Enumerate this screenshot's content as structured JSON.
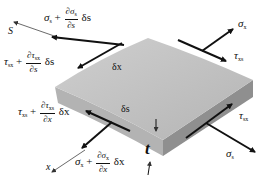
{
  "diagram": {
    "type": "plate-element-stress-diagram",
    "colors": {
      "plate_top": "#c2c2c2",
      "plate_front": "#a9a9a9",
      "plate_side": "#8e8e8e",
      "arrow": "#111111",
      "text": "#111111"
    },
    "labels": {
      "s_axis": "S",
      "x_axis": "x",
      "thickness": "t",
      "delta_x_edge": "δx",
      "delta_s_edge": "δs",
      "sigma_x": "σ",
      "sigma_x_sub": "x",
      "tau_xs": "τ",
      "tau_xs_sub": "xs",
      "sigma_s": "σ",
      "sigma_s_sub": "s",
      "tau_sx": "τ",
      "tau_sx_sub": "sx",
      "sigma_s_plus": {
        "base": "σ",
        "base_sub": "s",
        "plus": "+",
        "num": "∂σ",
        "num_sub": "s",
        "den": "∂s",
        "tail": "δs"
      },
      "tau_sx_plus": {
        "base": "τ",
        "base_sub": "sx",
        "plus": "+",
        "num": "∂τ",
        "num_sub": "sx",
        "den": "∂s",
        "tail": "δs"
      },
      "tau_xs_plus": {
        "base": "τ",
        "base_sub": "xs",
        "plus": "+",
        "num": "∂τ",
        "num_sub": "xs",
        "den": "∂x",
        "tail": "δx"
      },
      "sigma_x_plus": {
        "base": "σ",
        "base_sub": "x",
        "plus": "+",
        "num": "∂σ",
        "num_sub": "x",
        "den": "∂x",
        "tail": "δx"
      }
    }
  }
}
